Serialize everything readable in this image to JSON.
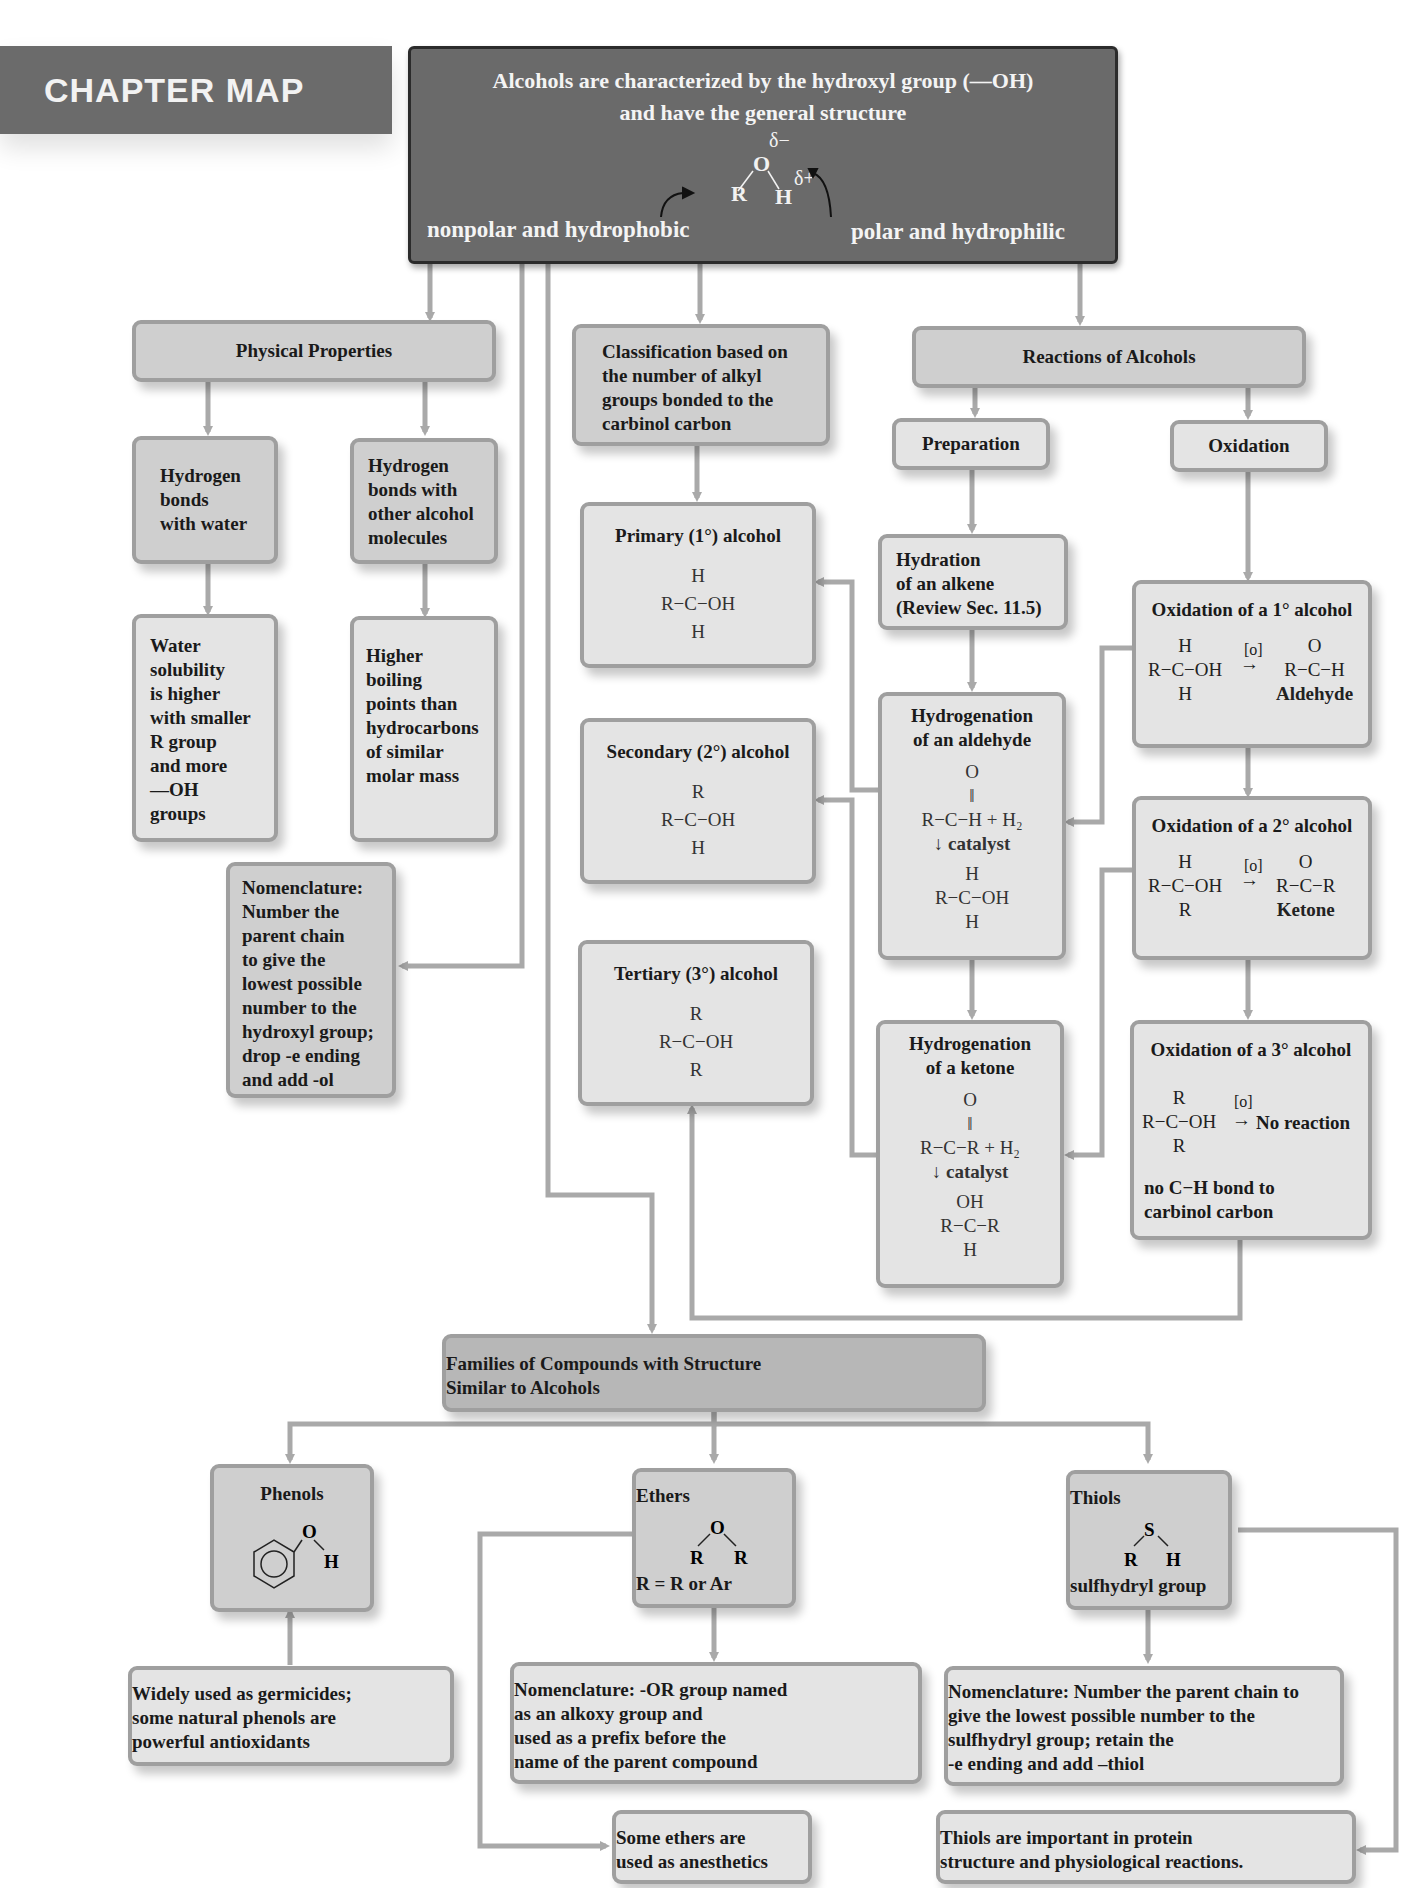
{
  "page_header": {
    "section": "Chapter Map",
    "page_number": "451"
  },
  "chapter_map_label": "CHAPTER MAP",
  "main": {
    "line1": "Alcohols are characterized by the hydroxyl group (—OH)",
    "line2": "and have the general structure",
    "structure": {
      "R": "R",
      "O": "O",
      "H": "H",
      "delta_minus": "δ−",
      "delta_plus": "δ+"
    },
    "left_label": "nonpolar and hydrophobic",
    "right_label": "polar and hydrophilic"
  },
  "physical": {
    "title": "Physical Properties",
    "hbond_water": [
      "Hydrogen",
      "bonds",
      "with water"
    ],
    "hbond_alcohol": [
      "Hydrogen",
      "bonds with",
      "other alcohol",
      "molecules"
    ],
    "solubility": [
      "Water",
      "solubility",
      "is higher",
      "with smaller",
      "R group",
      "and more",
      "—OH",
      "groups"
    ],
    "boiling": [
      "Higher",
      "boiling",
      "points than",
      "hydrocarbons",
      "of similar",
      "molar mass"
    ],
    "nomenclature": [
      "Nomenclature:",
      "Number the",
      "parent chain",
      "to give the",
      "lowest possible",
      "number to the",
      "hydroxyl group;",
      "drop -e ending",
      "and add -ol"
    ]
  },
  "classification": {
    "title": [
      "Classification based on",
      "the number of alkyl",
      "groups bonded to the",
      "carbinol carbon"
    ],
    "primary": {
      "title": "Primary (1°) alcohol",
      "top": "H",
      "mid": "R−C−OH",
      "bot": "H"
    },
    "secondary": {
      "title": "Secondary (2°) alcohol",
      "top": "R",
      "mid": "R−C−OH",
      "bot": "H"
    },
    "tertiary": {
      "title": "Tertiary (3°) alcohol",
      "top": "R",
      "mid": "R−C−OH",
      "bot": "R"
    }
  },
  "reactions": {
    "title": "Reactions of Alcohols",
    "preparation": "Preparation",
    "oxidation": "Oxidation",
    "hydration": [
      "Hydration",
      "of an alkene",
      "(Review Sec. 11.5)"
    ],
    "hyd_aldehyde": {
      "title": [
        "Hydrogenation",
        "of an aldehyde"
      ],
      "o": "O",
      "reactant": "R−C−H + H₂",
      "catalyst": "catalyst",
      "p_top": "H",
      "p_mid": "R−C−OH",
      "p_bot": "H"
    },
    "hyd_ketone": {
      "title": [
        "Hydrogenation",
        "of a ketone"
      ],
      "o": "O",
      "reactant": "R−C−R + H₂",
      "catalyst": "catalyst",
      "p_top": "OH",
      "p_mid": "R−C−R",
      "p_bot": "H"
    },
    "ox1": {
      "title": "Oxidation of a 1° alcohol",
      "top": "H",
      "mid": "R−C−OH",
      "bot": "H",
      "reagent": "[o]",
      "p_top": "O",
      "p_mid": "R−C−H",
      "product": "Aldehyde"
    },
    "ox2": {
      "title": "Oxidation of a 2° alcohol",
      "top": "H",
      "mid": "R−C−OH",
      "bot": "R",
      "reagent": "[o]",
      "p_top": "O",
      "p_mid": "R−C−R",
      "product": "Ketone"
    },
    "ox3": {
      "title": "Oxidation of a 3° alcohol",
      "top": "R",
      "mid": "R−C−OH",
      "bot": "R",
      "reagent": "[o]",
      "product": "No reaction",
      "note": [
        "no C−H bond to",
        "carbinol carbon"
      ]
    }
  },
  "families": {
    "title": [
      "Families of Compounds with Structure",
      "Similar to Alcohols"
    ],
    "phenols": {
      "title": "Phenols",
      "o": "O",
      "h": "H",
      "note": [
        "Widely used as germicides;",
        "some natural phenols are",
        "powerful antioxidants"
      ]
    },
    "ethers": {
      "title": "Ethers",
      "o": "O",
      "r1": "R",
      "r2": "R",
      "formula": "R = R or Ar",
      "nomenclature": [
        "Nomenclature: -OR group named",
        "as an alkoxy group and",
        "used as a prefix before the",
        "name of the parent compound"
      ],
      "note": [
        "Some ethers are",
        "used as anesthetics"
      ]
    },
    "thiols": {
      "title": "Thiols",
      "s": "S",
      "r": "R",
      "h": "H",
      "group": "sulfhydryl group",
      "nomenclature": [
        "Nomenclature: Number the parent chain to",
        "give the lowest possible number to the",
        "sulfhydryl group; retain the",
        "-e ending and add –thiol"
      ],
      "note": [
        "Thiols are important in protein",
        "structure and physiological reactions."
      ]
    }
  },
  "colors": {
    "connector": "#a9a9a9",
    "box_fill": "#e4e4e4",
    "box_border": "#9f9f9f",
    "dark_box": "#6a6a6a",
    "chapter_tab": "#6b6b6b"
  }
}
